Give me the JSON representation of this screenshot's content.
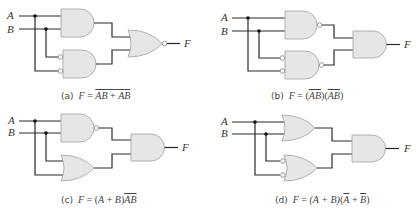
{
  "figure": {
    "inputs": [
      "A",
      "B"
    ],
    "output": "F",
    "colors": {
      "gate_fill": "#e6e6e6",
      "gate_stroke": "#a9a9a9",
      "wire": "#2a2a2a",
      "text": "#333333"
    },
    "panels": [
      {
        "id": "a",
        "tag": "(a)",
        "lhs": "F",
        "eq": "=",
        "expression": "AB + ĀB̄ (whole expression overlined)",
        "expr_parts": {
          "t1": "AB",
          "plus": "+",
          "t2a": "A",
          "t2b": "B",
          "overline_all": true
        },
        "gates": [
          {
            "name": "gate-1",
            "type": "AND",
            "inputs": [
              "A",
              "B"
            ]
          },
          {
            "name": "gate-2",
            "type": "AND",
            "inverted_inputs": true,
            "inputs": [
              "A",
              "B"
            ]
          },
          {
            "name": "gate-out",
            "type": "NOR"
          }
        ]
      },
      {
        "id": "b",
        "tag": "(b)",
        "lhs": "F",
        "eq": "=",
        "expression": "(AB̄)(ĀB̄̄)",
        "expr_parts": {
          "g1": "AB",
          "g2": "AB"
        },
        "gates": [
          {
            "name": "gate-1",
            "type": "NAND",
            "inputs": [
              "A",
              "B"
            ]
          },
          {
            "name": "gate-2",
            "type": "NAND",
            "inverted_inputs": true,
            "inputs": [
              "A",
              "B"
            ]
          },
          {
            "name": "gate-out",
            "type": "AND"
          }
        ]
      },
      {
        "id": "c",
        "tag": "(c)",
        "lhs": "F",
        "eq": "=",
        "expression": "(A + B)AB̄",
        "expr_parts": {
          "sum_open": "(",
          "a": "A",
          "plus": "+",
          "b": "B",
          "sum_close": ")",
          "prod": "AB"
        },
        "gates": [
          {
            "name": "gate-1",
            "type": "NAND",
            "inputs": [
              "A",
              "B"
            ]
          },
          {
            "name": "gate-2",
            "type": "OR",
            "inputs": [
              "A",
              "B"
            ]
          },
          {
            "name": "gate-out",
            "type": "AND"
          }
        ]
      },
      {
        "id": "d",
        "tag": "(d)",
        "lhs": "F",
        "eq": "=",
        "expression": "(A + B)(Ā + B̄)",
        "expr_parts": {
          "s1": "(A + B)",
          "open": "(",
          "na": "A",
          "plus": "+",
          "nb": "B",
          "close": ")"
        },
        "gates": [
          {
            "name": "gate-1",
            "type": "OR",
            "inputs": [
              "A",
              "B"
            ]
          },
          {
            "name": "gate-2",
            "type": "OR",
            "inverted_inputs": true,
            "inputs": [
              "A",
              "B"
            ]
          },
          {
            "name": "gate-out",
            "type": "AND"
          }
        ]
      }
    ]
  }
}
